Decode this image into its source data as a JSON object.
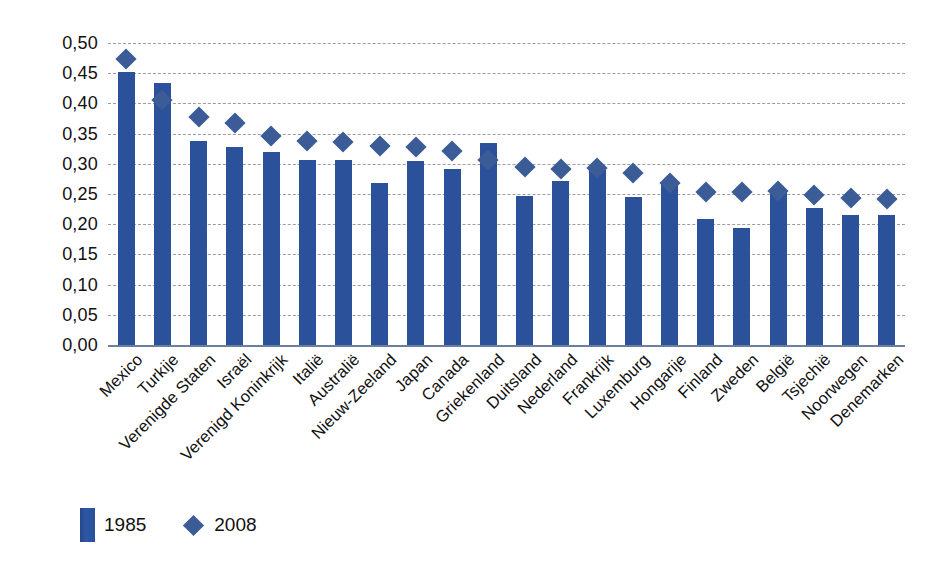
{
  "chart_data": {
    "type": "bar",
    "title": "",
    "subtitle": "",
    "xlabel": "",
    "ylabel": "",
    "ylim": [
      0,
      0.5
    ],
    "ytick_step": 0.05,
    "grid": true,
    "decimal_separator": ",",
    "legend_position": "bottom-left",
    "categories": [
      "Mexico",
      "Turkije",
      "Verenigde Staten",
      "Israël",
      "Verenigd Koninkrijk",
      "Italië",
      "Australië",
      "Nieuw-Zeeland",
      "Japan",
      "Canada",
      "Griekenland",
      "Duitsland",
      "Nederland",
      "Frankrijk",
      "Luxemburg",
      "Hongarije",
      "Finland",
      "Zweden",
      "België",
      "Tsjechië",
      "Noorwegen",
      "Denemarken"
    ],
    "ytick_labels": [
      "0,50",
      "0,45",
      "0,40",
      "0,35",
      "0,30",
      "0,25",
      "0,20",
      "0,15",
      "0,10",
      "0,05",
      "0,00"
    ],
    "ytick_values": [
      0.5,
      0.45,
      0.4,
      0.35,
      0.3,
      0.25,
      0.2,
      0.15,
      0.1,
      0.05,
      0.0
    ],
    "series": [
      {
        "name": "1985",
        "marker": "bar",
        "color": "#2b519b",
        "values": [
          0.452,
          0.434,
          0.338,
          0.328,
          0.32,
          0.307,
          0.306,
          0.268,
          0.304,
          0.291,
          0.335,
          0.247,
          0.272,
          0.29,
          0.245,
          0.268,
          0.208,
          0.194,
          0.253,
          0.227,
          0.216,
          0.215
        ]
      },
      {
        "name": "2008",
        "marker": "diamond",
        "color": "#3b5c96",
        "values": [
          0.473,
          0.405,
          0.378,
          0.368,
          0.346,
          0.337,
          0.336,
          0.33,
          0.328,
          0.322,
          0.307,
          0.295,
          0.292,
          0.293,
          0.285,
          0.268,
          0.254,
          0.254,
          0.255,
          0.249,
          0.243,
          0.241
        ]
      }
    ]
  },
  "legend": {
    "items": [
      {
        "label": "1985",
        "marker": "bar"
      },
      {
        "label": "2008",
        "marker": "diamond"
      }
    ]
  },
  "colors": {
    "bar": "#2b519b",
    "diamond": "#3b5c96",
    "gridline": "#8c8c8c",
    "baseline": "#6b7f9e",
    "text": "#111111",
    "background": "#ffffff"
  }
}
